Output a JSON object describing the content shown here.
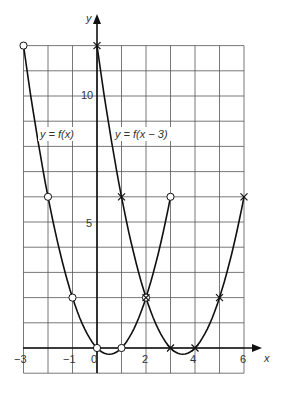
{
  "chart_data": {
    "type": "line",
    "title": "",
    "xlabel": "x",
    "ylabel": "y",
    "xlim": [
      -3,
      6
    ],
    "ylim": [
      -1,
      12
    ],
    "grid": true,
    "x_ticks": [
      "-3",
      "-1",
      "0",
      "2",
      "4",
      "6"
    ],
    "y_ticks": [
      "5",
      "10"
    ],
    "series": [
      {
        "name": "y = f(x)",
        "marker": "circle",
        "x": [
          -3,
          -2,
          -1,
          0,
          1,
          2,
          3
        ],
        "y": [
          12,
          6,
          2,
          0,
          0,
          2,
          6
        ]
      },
      {
        "name": "y = f(x − 3)",
        "marker": "cross",
        "x": [
          0,
          1,
          2,
          3,
          4,
          5,
          6
        ],
        "y": [
          12,
          6,
          2,
          0,
          0,
          2,
          6
        ]
      }
    ],
    "annotations": [
      "y = f(x)",
      "y = f(x − 3)"
    ]
  },
  "labels": {
    "x_axis": "x",
    "y_axis": "y",
    "curve1": "y = f(x)",
    "curve2": "y = f(x − 3)",
    "xt_m3": "−3",
    "xt_m1": "−1",
    "xt_0": "0",
    "xt_2": "2",
    "xt_4": "4",
    "xt_6": "6",
    "yt_5": "5",
    "yt_10": "10"
  }
}
